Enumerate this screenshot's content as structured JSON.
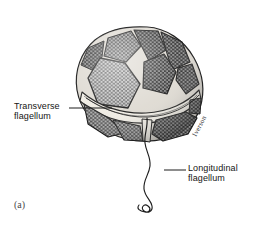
{
  "figure": {
    "panel_letter": "(a)",
    "background_color": "#ffffff",
    "ink_color": "#1a1a1a",
    "artist_signature": "Iverson",
    "width_px": 270,
    "height_px": 228
  },
  "labels": {
    "transverse": {
      "line1": "Transverse",
      "line2": "flagellum",
      "name": "Transverse flagellum"
    },
    "longitudinal": {
      "line1": "Longitudinal",
      "line2": "flagellum",
      "name": "Longitudinal flagellum"
    }
  },
  "leader_lines": {
    "transverse_leader": "horizontal rule from label to cingulum groove",
    "longitudinal_leader": "horizontal rule from label to trailing flagellum"
  },
  "organism": {
    "type": "dinoflagellate",
    "structure": "polygonal thecal plates with reticulate honeycomb ornamentation",
    "plate_count_visible": 9,
    "features": [
      "epitheca",
      "hypotheca",
      "cingulum",
      "sulcus",
      "transverse flagellum",
      "longitudinal flagellum"
    ]
  }
}
